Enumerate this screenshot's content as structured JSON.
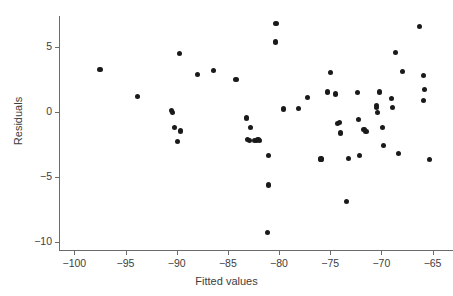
{
  "chart_data": {
    "type": "scatter",
    "title": "",
    "xlabel": "Fitted values",
    "ylabel": "Residuals",
    "xlim": [
      -101.5,
      -63.0
    ],
    "ylim": [
      -10.6,
      7.4
    ],
    "xticks": [
      -100,
      -95,
      -90,
      -85,
      -80,
      -75,
      -70,
      -65
    ],
    "xticklabels": [
      "−100",
      "−95",
      "−90",
      "−85",
      "−80",
      "−75",
      "−70",
      "−65"
    ],
    "yticks": [
      5,
      0,
      -5,
      -10
    ],
    "yticklabels": [
      "5",
      "0",
      "−5",
      "−10"
    ],
    "grid": false,
    "legend": null,
    "marker": {
      "shape": "circle",
      "color": "#1a1a1a",
      "size": 5.2
    },
    "series": [
      {
        "name": "residuals",
        "points": [
          [
            -97.5,
            3.3
          ],
          [
            -93.8,
            1.2
          ],
          [
            -90.5,
            0.1
          ],
          [
            -90.4,
            -0.05
          ],
          [
            -90.2,
            -1.2
          ],
          [
            -89.9,
            -2.25
          ],
          [
            -89.75,
            4.5
          ],
          [
            -89.6,
            -1.45
          ],
          [
            -88.0,
            2.9
          ],
          [
            -86.4,
            3.2
          ],
          [
            -84.2,
            2.5
          ],
          [
            -83.2,
            -0.45
          ],
          [
            -83.1,
            -2.1
          ],
          [
            -82.9,
            -2.15
          ],
          [
            -82.8,
            -1.2
          ],
          [
            -82.4,
            -2.15
          ],
          [
            -82.2,
            -2.2
          ],
          [
            -82.05,
            -2.1
          ],
          [
            -81.9,
            -2.15
          ],
          [
            -80.3,
            6.8
          ],
          [
            -80.35,
            5.4
          ],
          [
            -81.0,
            -3.3
          ],
          [
            -81.05,
            -5.6
          ],
          [
            -81.1,
            -9.25
          ],
          [
            -79.6,
            0.25
          ],
          [
            -78.1,
            0.3
          ],
          [
            -77.2,
            1.1
          ],
          [
            -75.9,
            -3.6
          ],
          [
            -75.3,
            1.55
          ],
          [
            -75.0,
            3.05
          ],
          [
            -74.5,
            1.4
          ],
          [
            -74.3,
            -0.85
          ],
          [
            -74.1,
            -0.8
          ],
          [
            -74.0,
            -1.6
          ],
          [
            -73.4,
            -6.85
          ],
          [
            -73.2,
            -3.55
          ],
          [
            -72.3,
            1.5
          ],
          [
            -72.2,
            -0.55
          ],
          [
            -72.1,
            -3.35
          ],
          [
            -71.7,
            -1.35
          ],
          [
            -71.5,
            -1.5
          ],
          [
            -70.5,
            0.5
          ],
          [
            -70.45,
            0.35
          ],
          [
            -70.4,
            0.0
          ],
          [
            -70.2,
            1.55
          ],
          [
            -69.9,
            -1.2
          ],
          [
            -69.8,
            -2.55
          ],
          [
            -69.0,
            1.05
          ],
          [
            -68.9,
            0.35
          ],
          [
            -68.6,
            4.6
          ],
          [
            -68.3,
            -3.15
          ],
          [
            -67.9,
            3.15
          ],
          [
            -66.3,
            6.6
          ],
          [
            -65.9,
            2.85
          ],
          [
            -65.8,
            1.75
          ],
          [
            -65.9,
            0.9
          ],
          [
            -65.3,
            -3.65
          ]
        ]
      }
    ]
  }
}
